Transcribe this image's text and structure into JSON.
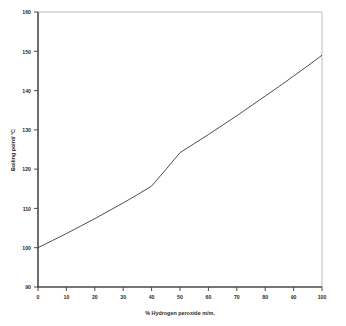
{
  "chart_data": {
    "type": "line",
    "title": "",
    "xlabel": "% Hydrogen peroxide m/m.",
    "ylabel": "Boiling point/ °C",
    "xlim": [
      0,
      100
    ],
    "ylim": [
      90,
      160
    ],
    "grid": false,
    "legend": "none",
    "xticks": [
      "0",
      "10",
      "20",
      "30",
      "40",
      "50",
      "60",
      "70",
      "80",
      "90",
      "100"
    ],
    "yticks": [
      "90",
      "100",
      "110",
      "120",
      "130",
      "140",
      "150",
      "160"
    ],
    "series": [
      {
        "name": "Boiling point vs % hydrogen peroxide",
        "x": [
          0,
          5,
          10,
          15,
          20,
          25,
          30,
          35,
          40,
          45,
          50,
          55,
          60,
          65,
          70,
          75,
          80,
          85,
          90,
          95,
          100
        ],
        "values": [
          100.0,
          101.8,
          103.6,
          105.5,
          107.4,
          109.4,
          111.4,
          113.5,
          115.7,
          119.9,
          124.2,
          126.5,
          128.8,
          131.2,
          133.6,
          136.1,
          138.6,
          141.1,
          143.7,
          146.3,
          149.0
        ]
      }
    ]
  },
  "figure": {
    "background_color": "#ffffff",
    "line_color": "#3a3a3a",
    "axis_color": "#4a4a4a",
    "frame_light_color": "#b6b6b6"
  }
}
